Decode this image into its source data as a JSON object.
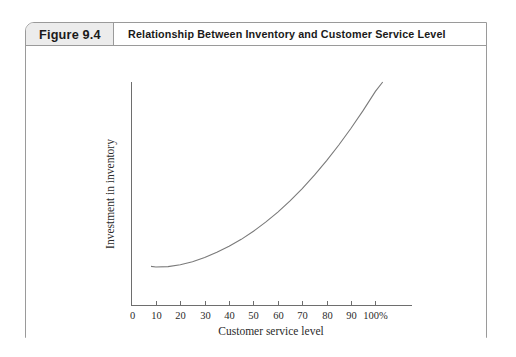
{
  "figure": {
    "number_label": "Figure 9.4",
    "title": "Relationship Between Inventory and Customer Service Level"
  },
  "chart_data": {
    "type": "line",
    "title": "Relationship Between Inventory and Customer Service Level",
    "xlabel": "Customer service level",
    "ylabel": "Investment in inventory",
    "x_tick_labels": [
      "0",
      "10",
      "20",
      "30",
      "40",
      "50",
      "60",
      "70",
      "80",
      "90",
      "100%"
    ],
    "x_ticks": [
      0,
      10,
      20,
      30,
      40,
      50,
      60,
      70,
      80,
      90,
      100
    ],
    "xlim": [
      0,
      115
    ],
    "ylim": [
      0,
      100
    ],
    "y_ticks": [],
    "y_tick_labels": [],
    "grid": false,
    "legend": null,
    "series": [
      {
        "name": "Investment in inventory",
        "x": [
          8,
          10,
          15,
          20,
          25,
          30,
          35,
          40,
          45,
          50,
          55,
          60,
          65,
          70,
          75,
          80,
          85,
          90,
          95,
          100,
          103
        ],
        "y": [
          17.5,
          17.2,
          17.4,
          18.2,
          19.6,
          21.5,
          23.8,
          26.5,
          29.6,
          33.2,
          37.3,
          41.8,
          46.8,
          52.3,
          58.3,
          64.8,
          71.8,
          79.3,
          87.3,
          95.8,
          100.0
        ]
      }
    ],
    "colors": {
      "curve": "#7a7a7a",
      "axis": "#6e6e6e",
      "frame_border": "#9a9a9a",
      "number_cell_background": "#ececec",
      "text": "#1a1a1a",
      "background": "#ffffff"
    }
  }
}
